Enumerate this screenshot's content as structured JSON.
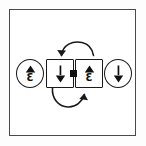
{
  "figure": {
    "background_color": "#ffffff",
    "frame_color": "#4a4a4a",
    "ink_color": "#111111",
    "nodes": [
      {
        "id": "node-0",
        "shape": "circle",
        "role": "standalone-bracket-up",
        "icon": "triangle-up-with-epsilon-icon",
        "glyph_top": "triangle-up",
        "glyph_bottom": "Ɛ",
        "label": ""
      },
      {
        "id": "node-1",
        "shape": "square",
        "role": "paired-bracket-down",
        "icon": "bar-with-triangle-down-icon",
        "glyph_top": "bar",
        "glyph_bottom": "triangle-down",
        "label": ""
      },
      {
        "id": "node-2",
        "shape": "square",
        "role": "paired-bracket-up",
        "icon": "triangle-up-with-epsilon-icon",
        "glyph_top": "triangle-up",
        "glyph_bottom": "Ɛ",
        "label": ""
      },
      {
        "id": "node-3",
        "shape": "circle",
        "role": "standalone-bracket-down",
        "icon": "bar-with-triangle-down-icon",
        "glyph_top": "bar",
        "glyph_bottom": "triangle-down",
        "label": ""
      }
    ],
    "connector": {
      "id": "pivot",
      "icon": "pivot-dot-icon",
      "between": [
        "node-1",
        "node-2"
      ]
    },
    "arrows": [
      {
        "id": "arc-top",
        "icon": "curved-arrow-counterclockwise-icon",
        "direction": "counterclockwise",
        "arrowhead": "left",
        "position": "above-pair"
      },
      {
        "id": "arc-bottom",
        "icon": "curved-arrow-counterclockwise-icon",
        "direction": "counterclockwise",
        "arrowhead": "right",
        "position": "below-pair"
      }
    ]
  }
}
